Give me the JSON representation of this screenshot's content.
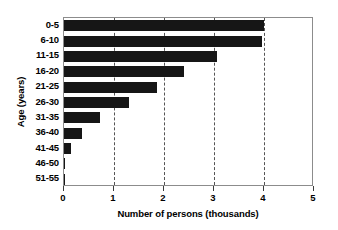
{
  "chart_data": {
    "type": "bar",
    "orientation": "horizontal",
    "title": "",
    "xlabel": "Number of persons (thousands)",
    "ylabel": "Age (years)",
    "categories": [
      "0-5",
      "6-10",
      "11-15",
      "16-20",
      "21-25",
      "26-30",
      "31-35",
      "36-40",
      "41-45",
      "46-50",
      "51-55"
    ],
    "values": [
      4.0,
      3.95,
      3.05,
      2.4,
      1.85,
      1.3,
      0.72,
      0.35,
      0.13,
      0.02,
      0.01
    ],
    "xlim": [
      0,
      5
    ],
    "xticks": [
      0,
      1,
      2,
      3,
      4,
      5
    ],
    "xtick_labels": [
      "0",
      "1",
      "2",
      "3",
      "4",
      "5"
    ],
    "gridlines": [
      1,
      2,
      3,
      4
    ],
    "grid": true,
    "grid_style": "dashed",
    "legend": false,
    "bar_color": "#161616",
    "frame_color": "#8c8c8c",
    "grid_color": "#555555",
    "background": "#ffffff"
  }
}
